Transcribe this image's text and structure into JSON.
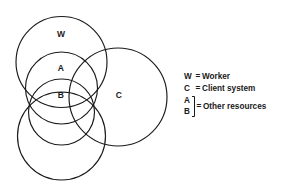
{
  "diagram": {
    "stroke_color": "#1a1a1a",
    "background_color": "#ffffff",
    "circles": [
      {
        "id": "W",
        "label": "W",
        "cx": 61.5,
        "cy": 62,
        "r": 45.5,
        "label_x": 61,
        "label_y": 34
      },
      {
        "id": "A",
        "label": "A",
        "cx": 61.5,
        "cy": 88,
        "r": 36,
        "label_x": 61,
        "label_y": 68
      },
      {
        "id": "B",
        "label": "B",
        "cx": 61.5,
        "cy": 112,
        "r": 33,
        "label_x": 61,
        "label_y": 95
      },
      {
        "id": "D",
        "label": "",
        "cx": 61.5,
        "cy": 136,
        "r": 44,
        "label_x": 0,
        "label_y": 0
      },
      {
        "id": "C",
        "label": "C",
        "cx": 118,
        "cy": 97,
        "r": 49,
        "label_x": 119,
        "label_y": 95
      }
    ]
  },
  "legend": {
    "rows": [
      {
        "key": "W",
        "equals": "=",
        "text": "Worker"
      },
      {
        "key": "C",
        "equals": "=",
        "text": "Client system"
      }
    ],
    "grouped_row": {
      "keys": [
        "A",
        "B"
      ],
      "equals": "=",
      "text": "Other resources"
    }
  }
}
